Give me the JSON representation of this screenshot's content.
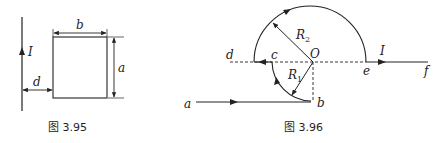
{
  "figures": [
    {
      "caption": "图 3.95",
      "labels": {
        "current": "I",
        "width": "b",
        "height": "a",
        "distance": "d"
      }
    },
    {
      "caption": "图 3.96",
      "labels": {
        "a": "a",
        "b": "b",
        "c": "c",
        "d": "d",
        "e": "e",
        "f": "f",
        "center": "O",
        "current": "I",
        "r1": "R",
        "r1_sub": "1",
        "r2": "R",
        "r2_sub": "2"
      }
    }
  ],
  "colors": {
    "line": "#222222",
    "background": "#ffffff"
  }
}
